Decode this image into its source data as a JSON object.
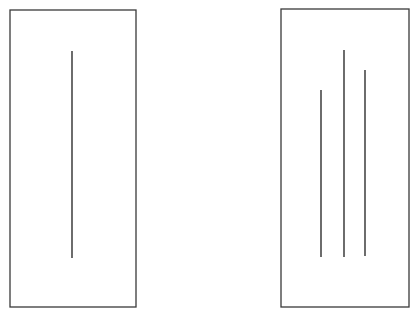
{
  "diagram": {
    "colors": {
      "background": "#ffffff",
      "card_border": "#3a3a3a",
      "line": "#2e2e2e"
    },
    "cards": [
      {
        "id": "reference-card",
        "x": 10,
        "y": 10,
        "width": 126,
        "height": 297,
        "lines": [
          {
            "id": "reference-line",
            "x": 72,
            "y1": 51,
            "y2": 258
          }
        ]
      },
      {
        "id": "comparison-card",
        "x": 281,
        "y": 9,
        "width": 128,
        "height": 298,
        "lines": [
          {
            "id": "comparison-line-a",
            "x": 321,
            "y1": 90,
            "y2": 257
          },
          {
            "id": "comparison-line-b",
            "x": 344,
            "y1": 50,
            "y2": 257
          },
          {
            "id": "comparison-line-c",
            "x": 365,
            "y1": 70,
            "y2": 256
          }
        ]
      }
    ]
  }
}
